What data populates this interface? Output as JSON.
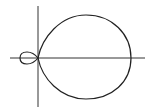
{
  "figure": {
    "colors": {
      "background": "#ffffff",
      "axis": "#333333",
      "curve": "#222222"
    }
  },
  "axes": {
    "origin_px": [
      38,
      58
    ],
    "x_axis_px": [
      10,
      145
    ],
    "y_axis_px": [
      6,
      107
    ]
  },
  "curve": {
    "outer_loop": {
      "right_px": 131,
      "top_px": [
        86,
        15
      ],
      "bottom_px": [
        86,
        99
      ]
    },
    "inner_loop": {
      "left_px": 20,
      "top_px": [
        28,
        52
      ],
      "bottom_px": [
        28,
        64
      ]
    }
  }
}
